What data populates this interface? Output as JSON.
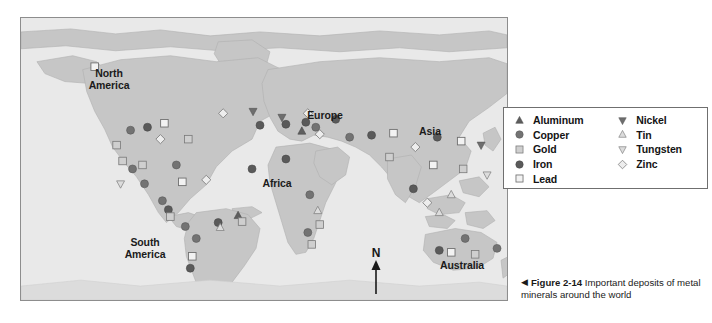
{
  "figure": {
    "caption_arrow": "◀",
    "caption_number": "Figure 2-14",
    "caption_text": "Important deposits of metal minerals around the world"
  },
  "map": {
    "compass": {
      "label": "N",
      "icon": "north-arrow-icon"
    },
    "ocean_color": "#e9e9e9",
    "land_color": "#c6c6c6",
    "border_color": "#8d8d8d",
    "symbol_dark_color": "#5e5e5e",
    "symbol_light_color": "#d8d8d8",
    "symbol_outline_color": "#6a6a6a",
    "labels": [
      {
        "name": "north-america",
        "text": "North\nAmerica",
        "x": 88,
        "y": 50
      },
      {
        "name": "south-america",
        "text": "South\nAmerica",
        "x": 124,
        "y": 219
      },
      {
        "name": "europe",
        "text": "Europe",
        "x": 304,
        "y": 92
      },
      {
        "name": "africa",
        "text": "Africa",
        "x": 256,
        "y": 160
      },
      {
        "name": "asia",
        "text": "Asia",
        "x": 409,
        "y": 108
      },
      {
        "name": "australia",
        "text": "Australia",
        "x": 441,
        "y": 242
      }
    ]
  },
  "legend": {
    "title": "Metal mineral deposits",
    "columns": [
      {
        "name": "legend-column-left",
        "items": [
          {
            "label": "Aluminum",
            "symbol": "triangle-up",
            "fill": "dark",
            "icon": "triangle-up-dark-icon"
          },
          {
            "label": "Copper",
            "symbol": "circle",
            "fill": "mid",
            "icon": "circle-mid-icon"
          },
          {
            "label": "Gold",
            "symbol": "square",
            "fill": "light",
            "icon": "square-light-icon"
          },
          {
            "label": "Iron",
            "symbol": "circle",
            "fill": "dark",
            "icon": "circle-dark-icon"
          },
          {
            "label": "Lead",
            "symbol": "square",
            "fill": "open",
            "icon": "square-open-icon"
          }
        ]
      },
      {
        "name": "legend-column-right",
        "items": [
          {
            "label": "Nickel",
            "symbol": "triangle-down",
            "fill": "mid",
            "icon": "triangle-down-mid-icon"
          },
          {
            "label": "Tin",
            "symbol": "triangle-up",
            "fill": "light",
            "icon": "triangle-up-light-icon"
          },
          {
            "label": "Tungsten",
            "symbol": "triangle-down",
            "fill": "light",
            "icon": "triangle-down-light-icon"
          },
          {
            "label": "Zinc",
            "symbol": "diamond",
            "fill": "open",
            "icon": "diamond-open-icon"
          }
        ]
      }
    ]
  },
  "chart_data": {
    "type": "map",
    "title": "Important deposits of metal minerals around the world",
    "projection": "world-equirectangular",
    "legend_position": "right",
    "deposit_symbols": [
      "Aluminum",
      "Copper",
      "Gold",
      "Iron",
      "Lead",
      "Nickel",
      "Tin",
      "Tungsten",
      "Zinc"
    ],
    "deposits": [
      {
        "mineral": "Lead",
        "x": 74,
        "y": 49
      },
      {
        "mineral": "Zinc",
        "x": 203,
        "y": 96
      },
      {
        "mineral": "Nickel",
        "x": 233,
        "y": 94
      },
      {
        "mineral": "Copper",
        "x": 110,
        "y": 113
      },
      {
        "mineral": "Iron",
        "x": 127,
        "y": 110
      },
      {
        "mineral": "Lead",
        "x": 144,
        "y": 106
      },
      {
        "mineral": "Zinc",
        "x": 140,
        "y": 122
      },
      {
        "mineral": "Gold",
        "x": 96,
        "y": 128
      },
      {
        "mineral": "Gold",
        "x": 168,
        "y": 122
      },
      {
        "mineral": "Iron",
        "x": 240,
        "y": 108
      },
      {
        "mineral": "Iron",
        "x": 266,
        "y": 107
      },
      {
        "mineral": "Iron",
        "x": 286,
        "y": 105
      },
      {
        "mineral": "Zinc",
        "x": 300,
        "y": 117
      },
      {
        "mineral": "Nickel",
        "x": 262,
        "y": 100
      },
      {
        "mineral": "Gold",
        "x": 102,
        "y": 144
      },
      {
        "mineral": "Gold",
        "x": 122,
        "y": 148
      },
      {
        "mineral": "Copper",
        "x": 112,
        "y": 152
      },
      {
        "mineral": "Copper",
        "x": 156,
        "y": 148
      },
      {
        "mineral": "Tungsten",
        "x": 100,
        "y": 167
      },
      {
        "mineral": "Copper",
        "x": 124,
        "y": 167
      },
      {
        "mineral": "Lead",
        "x": 162,
        "y": 165
      },
      {
        "mineral": "Zinc",
        "x": 186,
        "y": 163
      },
      {
        "mineral": "Iron",
        "x": 232,
        "y": 152
      },
      {
        "mineral": "Iron",
        "x": 266,
        "y": 142
      },
      {
        "mineral": "Copper",
        "x": 142,
        "y": 184
      },
      {
        "mineral": "Iron",
        "x": 148,
        "y": 193
      },
      {
        "mineral": "Gold",
        "x": 150,
        "y": 200
      },
      {
        "mineral": "Aluminum",
        "x": 218,
        "y": 199
      },
      {
        "mineral": "Copper",
        "x": 165,
        "y": 210
      },
      {
        "mineral": "Iron",
        "x": 198,
        "y": 206
      },
      {
        "mineral": "Tin",
        "x": 200,
        "y": 211
      },
      {
        "mineral": "Gold",
        "x": 222,
        "y": 205
      },
      {
        "mineral": "Copper",
        "x": 176,
        "y": 222
      },
      {
        "mineral": "Lead",
        "x": 172,
        "y": 240
      },
      {
        "mineral": "Iron",
        "x": 170,
        "y": 252
      },
      {
        "mineral": "Aluminum",
        "x": 282,
        "y": 114
      },
      {
        "mineral": "Zinc",
        "x": 288,
        "y": 96
      },
      {
        "mineral": "Copper",
        "x": 296,
        "y": 110
      },
      {
        "mineral": "Iron",
        "x": 316,
        "y": 102
      },
      {
        "mineral": "Copper",
        "x": 330,
        "y": 120
      },
      {
        "mineral": "Iron",
        "x": 352,
        "y": 118
      },
      {
        "mineral": "Lead",
        "x": 374,
        "y": 116
      },
      {
        "mineral": "Gold",
        "x": 370,
        "y": 140
      },
      {
        "mineral": "Zinc",
        "x": 396,
        "y": 130
      },
      {
        "mineral": "Iron",
        "x": 418,
        "y": 120
      },
      {
        "mineral": "Lead",
        "x": 442,
        "y": 124
      },
      {
        "mineral": "Nickel",
        "x": 462,
        "y": 128
      },
      {
        "mineral": "Lead",
        "x": 414,
        "y": 148
      },
      {
        "mineral": "Gold",
        "x": 444,
        "y": 152
      },
      {
        "mineral": "Tungsten",
        "x": 468,
        "y": 158
      },
      {
        "mineral": "Iron",
        "x": 394,
        "y": 172
      },
      {
        "mineral": "Tin",
        "x": 432,
        "y": 178
      },
      {
        "mineral": "Zinc",
        "x": 408,
        "y": 186
      },
      {
        "mineral": "Tin",
        "x": 420,
        "y": 196
      },
      {
        "mineral": "Copper",
        "x": 290,
        "y": 178
      },
      {
        "mineral": "Tin",
        "x": 298,
        "y": 194
      },
      {
        "mineral": "Gold",
        "x": 300,
        "y": 208
      },
      {
        "mineral": "Copper",
        "x": 288,
        "y": 216
      },
      {
        "mineral": "Gold",
        "x": 292,
        "y": 228
      },
      {
        "mineral": "Copper",
        "x": 446,
        "y": 222
      },
      {
        "mineral": "Iron",
        "x": 420,
        "y": 234
      },
      {
        "mineral": "Lead",
        "x": 432,
        "y": 236
      },
      {
        "mineral": "Gold",
        "x": 456,
        "y": 238
      },
      {
        "mineral": "Copper",
        "x": 478,
        "y": 232
      }
    ]
  }
}
